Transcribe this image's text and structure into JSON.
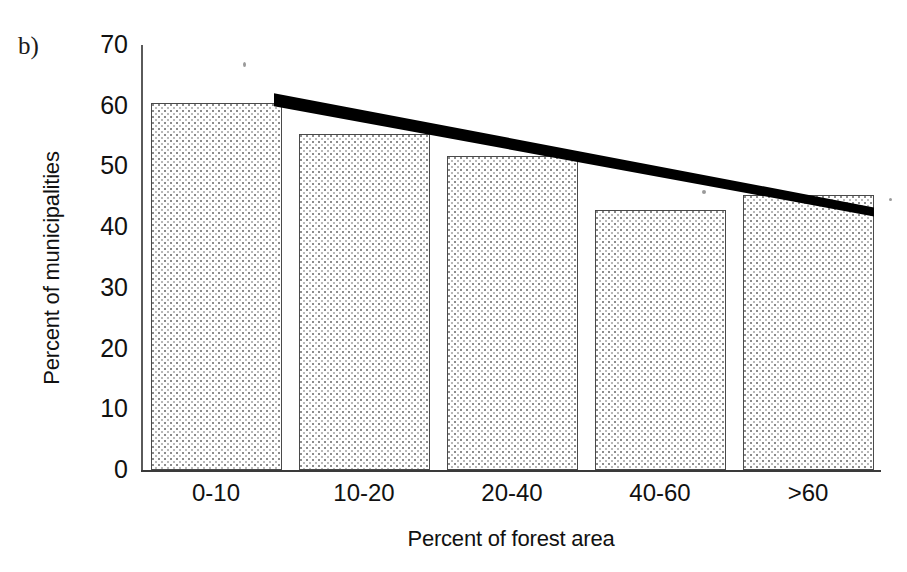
{
  "figure": {
    "panel_label": "b)"
  },
  "chart_data": {
    "type": "bar",
    "title": "",
    "categories": [
      "0-10",
      "10-20",
      "20-40",
      "40-60",
      ">60"
    ],
    "values": [
      60.5,
      55.3,
      51.8,
      42.8,
      45.3
    ],
    "xlabel": "Percent of forest area",
    "ylabel": "Percent of municipalities",
    "ylim": [
      0,
      70
    ],
    "yticks": [
      0,
      10,
      20,
      30,
      40,
      50,
      60,
      70
    ],
    "ytick_labels": [
      "0",
      "10",
      "20",
      "30",
      "40",
      "50",
      "60",
      "70"
    ],
    "grid": false,
    "legend": "none",
    "bar_fill": "stippled-gray-dots",
    "bar_edge_color": "#4a4a4a",
    "series": [
      {
        "name": "Percent of municipalities",
        "values": [
          60.5,
          55.3,
          51.8,
          42.8,
          45.3
        ]
      }
    ],
    "annotations": [
      {
        "type": "trendline",
        "name": "declining-trend-line",
        "color": "#000000",
        "style": "thick-solid",
        "x_start_category": "0-10",
        "x_end_category": ">60",
        "y_start": 61.0,
        "y_end": 42.5
      }
    ]
  }
}
